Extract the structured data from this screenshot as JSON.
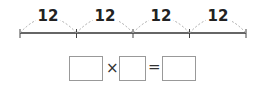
{
  "number_line": {
    "segments": [
      {
        "label": "12"
      },
      {
        "label": "12"
      },
      {
        "label": "12"
      },
      {
        "label": "12"
      }
    ],
    "tick_count": 5
  },
  "equation": {
    "box1_value": "",
    "operator1": "×",
    "box2_value": "",
    "operator2": "=",
    "box3_value": ""
  },
  "colors": {
    "line": "#333333",
    "arc": "#aaaaaa",
    "box_border": "#999999"
  }
}
